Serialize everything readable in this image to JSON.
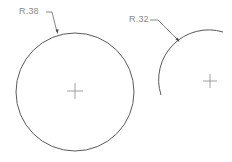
{
  "drawing": {
    "background": "#ffffff",
    "line_color": "#5a5a5a",
    "label_color": "#8a8a8a",
    "features": [
      {
        "type": "circle",
        "dimension_label": "R.38",
        "center_mark": "crosshair",
        "visible_extent": "full circle"
      },
      {
        "type": "arc",
        "dimension_label": "R.32",
        "center_mark": "crosshair",
        "visible_extent": "partial arc (upper-left quadrant)"
      }
    ]
  }
}
